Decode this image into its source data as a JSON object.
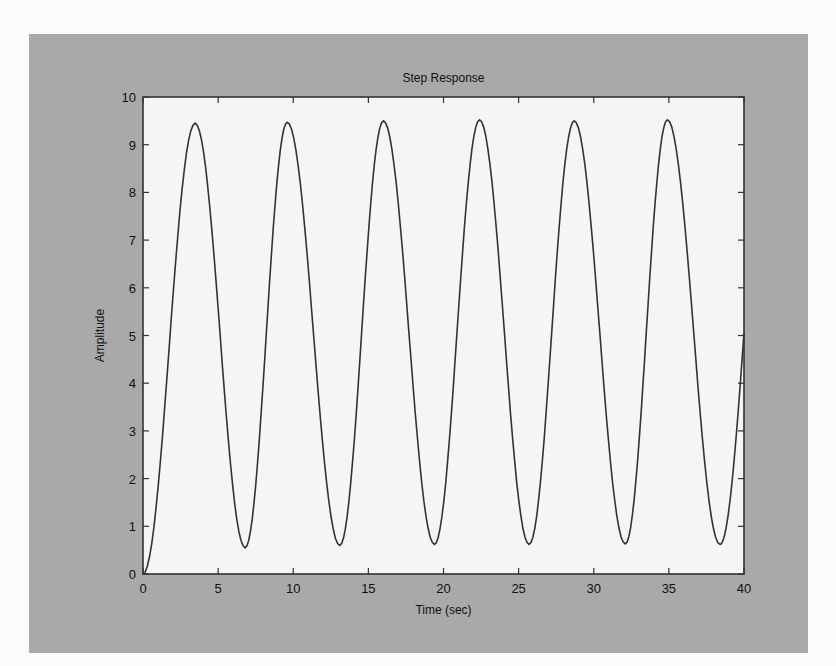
{
  "chart_data": {
    "type": "line",
    "title": "Step Response",
    "xlabel": "Time (sec)",
    "ylabel": "Amplitude",
    "xlim": [
      0,
      40
    ],
    "ylim": [
      0,
      10
    ],
    "xticks": [
      0,
      5,
      10,
      15,
      20,
      25,
      30,
      35,
      40
    ],
    "yticks": [
      0,
      1,
      2,
      3,
      4,
      5,
      6,
      7,
      8,
      9,
      10
    ],
    "grid": false,
    "legend": null,
    "series": [
      {
        "name": "Step Response",
        "color": "#333333",
        "x": [
          0,
          3.47,
          6.8,
          9.6,
          13.1,
          16.0,
          19.4,
          22.4,
          25.7,
          28.7,
          32.1,
          34.9,
          38.4,
          40
        ],
        "y": [
          0,
          9.45,
          0.55,
          9.47,
          0.6,
          9.5,
          0.62,
          9.52,
          0.62,
          9.5,
          0.63,
          9.52,
          0.62,
          6.1
        ]
      }
    ]
  },
  "colors": {
    "panel_background": "#a9a9a9",
    "plot_background": "#f5f5f5",
    "axis_color": "#333333",
    "line_color": "#333333"
  }
}
